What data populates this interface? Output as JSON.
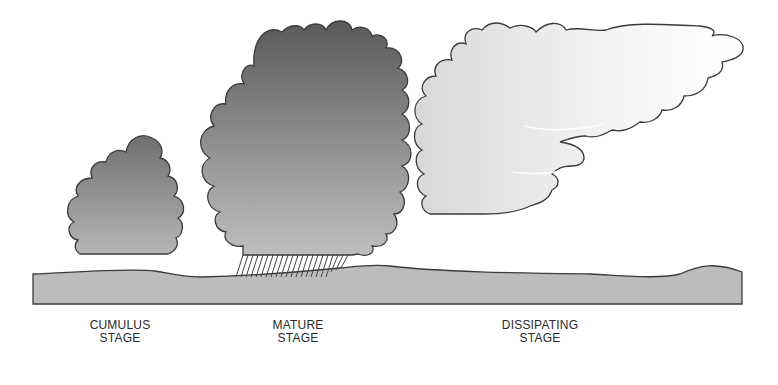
{
  "diagram": {
    "stages": [
      {
        "id": "cumulus",
        "line1": "CUMULUS",
        "line2": "STAGE"
      },
      {
        "id": "mature",
        "line1": "MATURE",
        "line2": "STAGE"
      },
      {
        "id": "dissipating",
        "line1": "DISSIPATING",
        "line2": "STAGE"
      }
    ],
    "colors": {
      "cumulus_top": "#6e6e6e",
      "cumulus_bottom": "#b4b4b4",
      "mature_top": "#5c5c5c",
      "mature_bottom": "#bdbdbd",
      "dissipating_fill": "#e6e6e6",
      "ground": "#bcbcbc",
      "outline": "#3a3a3a"
    }
  }
}
